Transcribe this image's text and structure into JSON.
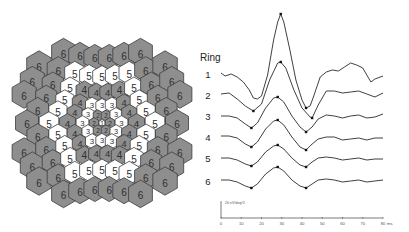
{
  "hex_map": {
    "center": [
      102,
      123
    ],
    "ring_colors": {
      "1": "#ffffff",
      "2": "#8e8e8e",
      "3": "#ffffff",
      "4": "#8e8e8e",
      "5": "#ffffff",
      "6": "#8e8e8e"
    },
    "outline_color": "#3c3c3c",
    "digit_color": "#2e2e2e",
    "rows": [
      [
        6,
        6,
        6,
        6,
        6,
        6
      ],
      [
        6,
        6,
        5,
        5,
        5,
        5,
        5,
        6,
        6
      ],
      [
        6,
        6,
        5,
        4,
        4,
        4,
        4,
        5,
        6,
        6
      ],
      [
        6,
        6,
        5,
        4,
        3,
        3,
        3,
        4,
        5,
        6,
        6
      ],
      [
        6,
        5,
        4,
        3,
        2,
        2,
        3,
        4,
        5,
        6
      ],
      [
        6,
        5,
        4,
        3,
        2,
        1,
        2,
        3,
        4,
        5,
        6
      ],
      [
        6,
        5,
        4,
        3,
        2,
        2,
        3,
        4,
        5,
        6
      ],
      [
        6,
        6,
        5,
        4,
        3,
        3,
        3,
        4,
        5,
        6,
        6
      ],
      [
        6,
        6,
        5,
        4,
        4,
        4,
        4,
        5,
        6,
        6
      ],
      [
        6,
        6,
        5,
        5,
        5,
        5,
        5,
        6,
        6
      ],
      [
        6,
        6,
        6,
        6,
        6,
        6
      ]
    ]
  },
  "chart_data": {
    "type": "line",
    "title": "",
    "legend_title": "Ring",
    "xlabel": "ms",
    "x_ticks": [
      "0",
      "10",
      "20",
      "30",
      "40",
      "50",
      "60",
      "70",
      "80"
    ],
    "xlim": [
      0,
      80
    ],
    "scale_bar_label": "20 nV/deg^2",
    "series": [
      {
        "name": "1",
        "points_ms_px": [
          [
            0,
            73
          ],
          [
            2,
            76
          ],
          [
            5,
            74
          ],
          [
            8,
            77
          ],
          [
            11,
            82
          ],
          [
            14,
            90
          ],
          [
            16,
            98
          ],
          [
            18,
            99
          ],
          [
            20,
            96
          ],
          [
            23,
            75
          ],
          [
            26,
            40
          ],
          [
            28,
            22
          ],
          [
            29.5,
            14
          ],
          [
            31,
            22
          ],
          [
            34,
            50
          ],
          [
            37,
            80
          ],
          [
            40,
            100
          ],
          [
            42,
            108
          ],
          [
            44,
            106
          ],
          [
            46,
            95
          ],
          [
            49,
            77
          ],
          [
            52,
            72
          ],
          [
            55,
            70
          ],
          [
            58,
            71
          ],
          [
            61,
            67
          ],
          [
            64,
            63
          ],
          [
            67,
            65
          ],
          [
            70,
            68
          ],
          [
            72,
            75
          ],
          [
            74,
            82
          ],
          [
            76,
            79
          ],
          [
            80,
            76
          ]
        ],
        "markers": [
          [
            29.5,
            14
          ],
          [
            42,
            108
          ]
        ]
      },
      {
        "name": "2",
        "points_ms_px": [
          [
            0,
            94
          ],
          [
            4,
            93
          ],
          [
            8,
            99
          ],
          [
            12,
            106
          ],
          [
            16,
            111
          ],
          [
            20,
            104
          ],
          [
            24,
            80
          ],
          [
            28,
            63
          ],
          [
            29.5,
            62
          ],
          [
            32,
            68
          ],
          [
            36,
            90
          ],
          [
            40,
            108
          ],
          [
            44,
            117
          ],
          [
            45,
            118
          ],
          [
            48,
            105
          ],
          [
            52,
            91
          ],
          [
            56,
            91
          ],
          [
            60,
            93
          ],
          [
            64,
            92
          ],
          [
            68,
            91
          ],
          [
            72,
            94
          ],
          [
            76,
            97
          ],
          [
            80,
            93
          ]
        ],
        "markers": [
          [
            16,
            111
          ],
          [
            29.5,
            62
          ],
          [
            45,
            118
          ]
        ]
      },
      {
        "name": "3",
        "points_ms_px": [
          [
            0,
            116
          ],
          [
            4,
            116
          ],
          [
            8,
            118
          ],
          [
            12,
            124
          ],
          [
            15,
            128
          ],
          [
            18,
            123
          ],
          [
            22,
            108
          ],
          [
            26,
            98
          ],
          [
            28,
            97
          ],
          [
            31,
            102
          ],
          [
            35,
            116
          ],
          [
            39,
            127
          ],
          [
            42,
            132
          ],
          [
            45,
            127
          ],
          [
            48,
            119
          ],
          [
            52,
            115
          ],
          [
            56,
            116
          ],
          [
            60,
            118
          ],
          [
            64,
            116
          ],
          [
            68,
            115
          ],
          [
            72,
            118
          ],
          [
            76,
            117
          ],
          [
            80,
            114
          ]
        ],
        "markers": [
          [
            15,
            128
          ],
          [
            28,
            97
          ],
          [
            42,
            132
          ]
        ]
      },
      {
        "name": "4",
        "points_ms_px": [
          [
            0,
            136
          ],
          [
            4,
            136
          ],
          [
            8,
            138
          ],
          [
            12,
            144
          ],
          [
            15,
            147
          ],
          [
            18,
            142
          ],
          [
            22,
            129
          ],
          [
            26,
            121
          ],
          [
            28,
            120
          ],
          [
            31,
            125
          ],
          [
            35,
            137
          ],
          [
            39,
            147
          ],
          [
            42,
            150
          ],
          [
            45,
            144
          ],
          [
            48,
            139
          ],
          [
            52,
            137
          ],
          [
            56,
            137
          ],
          [
            60,
            140
          ],
          [
            64,
            139
          ],
          [
            68,
            138
          ],
          [
            72,
            140
          ],
          [
            76,
            138
          ],
          [
            80,
            138
          ]
        ],
        "markers": [
          [
            15,
            147
          ],
          [
            28,
            120
          ],
          [
            42,
            150
          ]
        ]
      },
      {
        "name": "5",
        "points_ms_px": [
          [
            0,
            158
          ],
          [
            4,
            158
          ],
          [
            8,
            160
          ],
          [
            12,
            164
          ],
          [
            15,
            166
          ],
          [
            18,
            162
          ],
          [
            22,
            152
          ],
          [
            26,
            146
          ],
          [
            28,
            145
          ],
          [
            31,
            149
          ],
          [
            35,
            158
          ],
          [
            39,
            165
          ],
          [
            42,
            167
          ],
          [
            45,
            162
          ],
          [
            48,
            158
          ],
          [
            52,
            157
          ],
          [
            56,
            158
          ],
          [
            60,
            160
          ],
          [
            64,
            159
          ],
          [
            68,
            158
          ],
          [
            72,
            160
          ],
          [
            76,
            159
          ],
          [
            80,
            159
          ]
        ],
        "markers": [
          [
            15,
            166
          ],
          [
            28,
            145
          ],
          [
            42,
            167
          ]
        ]
      },
      {
        "name": "6",
        "points_ms_px": [
          [
            0,
            180
          ],
          [
            4,
            180
          ],
          [
            8,
            182
          ],
          [
            12,
            186
          ],
          [
            15,
            188
          ],
          [
            18,
            184
          ],
          [
            22,
            174
          ],
          [
            26,
            168
          ],
          [
            28,
            167
          ],
          [
            31,
            171
          ],
          [
            35,
            180
          ],
          [
            39,
            186
          ],
          [
            42,
            188
          ],
          [
            45,
            184
          ],
          [
            48,
            180
          ],
          [
            52,
            179
          ],
          [
            56,
            180
          ],
          [
            60,
            182
          ],
          [
            64,
            181
          ],
          [
            68,
            180
          ],
          [
            72,
            182
          ],
          [
            76,
            181
          ],
          [
            80,
            180
          ]
        ],
        "markers": [
          [
            15,
            188
          ],
          [
            28,
            167
          ],
          [
            42,
            188
          ]
        ]
      }
    ],
    "label_y_px": [
      74,
      95,
      116,
      137,
      158,
      181
    ],
    "grid": false
  },
  "axes": {
    "x0_px": 221,
    "x80_px": 383,
    "axis_y_px": 218,
    "scale_bar_top_px": 201
  }
}
